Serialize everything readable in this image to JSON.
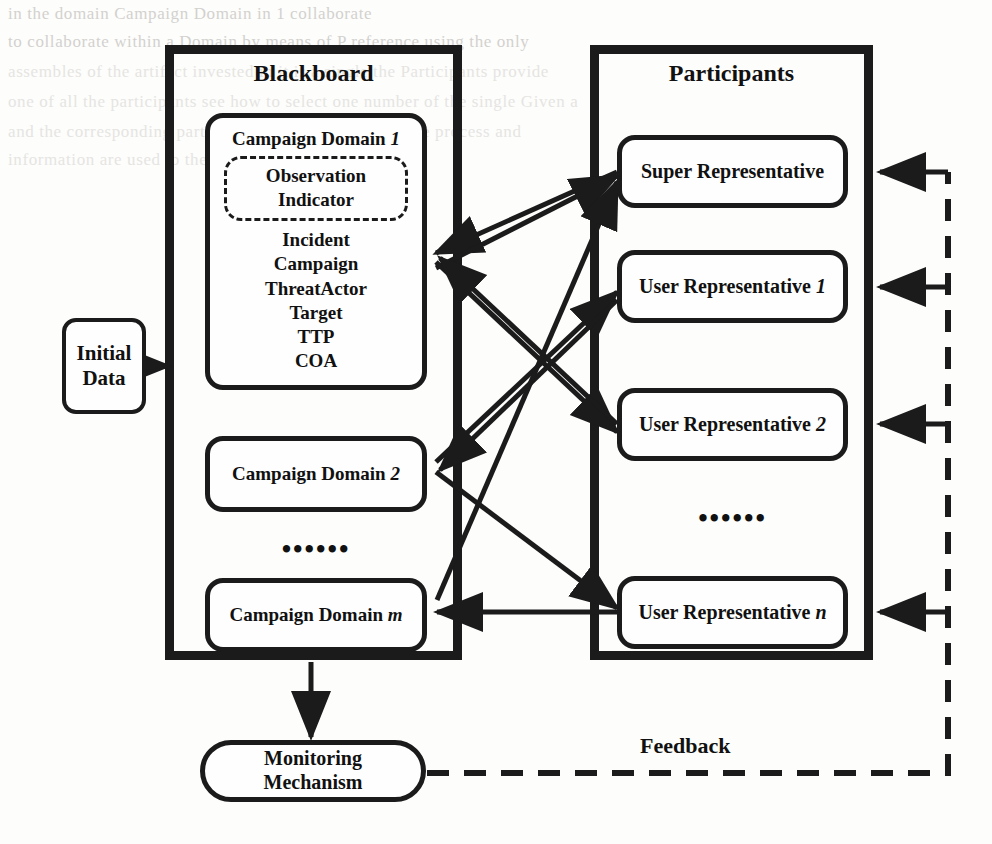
{
  "diagram": {
    "ink_color": "#1b1b1b",
    "background_color": "#fdfdfc"
  },
  "blackboard": {
    "title": "Blackboard",
    "domains": [
      {
        "title_prefix": "Campaign Domain ",
        "title_index": "1",
        "shared_space_lines": [
          "Observation",
          "Indicator"
        ],
        "entities": [
          "Incident",
          "Campaign",
          "ThreatActor",
          "Target",
          "TTP",
          "COA"
        ]
      },
      {
        "title_prefix": "Campaign Domain ",
        "title_index": "2"
      },
      {
        "title_prefix": "Campaign Domain ",
        "title_index": "m"
      }
    ],
    "ellipsis": "••••••"
  },
  "participants": {
    "title": "Participants",
    "members": [
      {
        "label_prefix": "Super Representative",
        "label_index": ""
      },
      {
        "label_prefix": "User Representative ",
        "label_index": "1"
      },
      {
        "label_prefix": "User Representative ",
        "label_index": "2"
      },
      {
        "label_prefix": "User Representative ",
        "label_index": "n"
      }
    ],
    "ellipsis": "••••••"
  },
  "initial_data": {
    "line1": "Initial",
    "line2": "Data"
  },
  "monitoring": {
    "line1": "Monitoring",
    "line2": "Mechanism"
  },
  "feedback": {
    "label": "Feedback"
  },
  "background_text": {
    "lines": [
      "in the   domain   Campaign Domain   in   1   collaborate",
      "to       collaborate   within a  Domain  by  means of   P   reference  using   the  only",
      "assembles of  the  artifact   invested in       it  is  a  single   the  Participants  provide",
      "one  of  all  the participants  see  how  to select  one  number of  the  single   Given  a",
      "and   the  corresponding  part  of  the    investigation   Given   the   process   and",
      "information  are  used to  the  detailed"
    ]
  }
}
